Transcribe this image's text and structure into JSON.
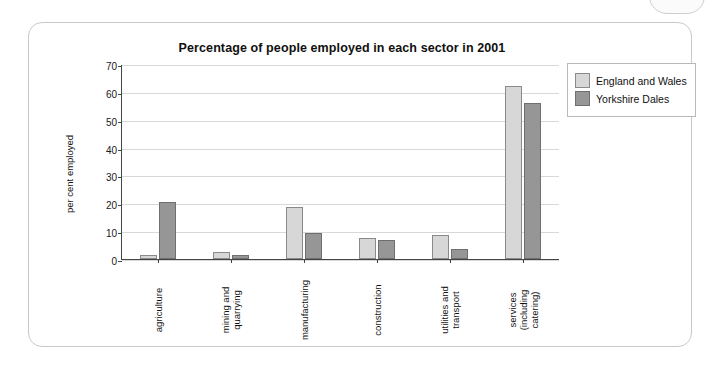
{
  "chart_data": {
    "type": "bar",
    "title": "Percentage of people employed in each sector in 2001",
    "xlabel": "",
    "ylabel": "per cent employed",
    "categories": [
      "agriculture",
      "mining and\nquarrying",
      "manufacturing",
      "construction",
      "utilities and\ntransport",
      "services\n(including\ncatering)"
    ],
    "series": [
      {
        "name": "England and Wales",
        "values": [
          1.5,
          2.5,
          18.5,
          7.5,
          8.5,
          62
        ],
        "color": "#d7d7d7"
      },
      {
        "name": "Yorkshire Dales",
        "values": [
          20.5,
          1.5,
          9.5,
          7,
          3.5,
          56
        ],
        "color": "#969696"
      }
    ],
    "ylim": [
      0,
      70
    ],
    "yticks": [
      0,
      10,
      20,
      30,
      40,
      50,
      60,
      70
    ],
    "grid": true,
    "legend_position": "top-right"
  }
}
